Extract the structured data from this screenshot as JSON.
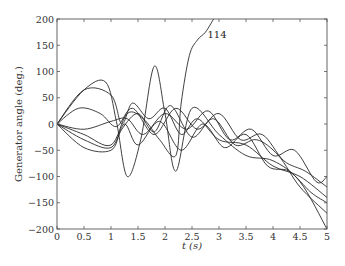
{
  "chart_data": {
    "type": "line",
    "title": "",
    "xlabel": "t (s)",
    "ylabel": "Generator angle (deg.)",
    "xlim": [
      0,
      5
    ],
    "ylim": [
      -200,
      200
    ],
    "grid": false,
    "legend": null,
    "xticks": [
      "0",
      "0.5",
      "1",
      "1.5",
      "2",
      "2.5",
      "3",
      "3.5",
      "4",
      "4.5",
      "5"
    ],
    "yticks": [
      "200",
      "150",
      "100",
      "50",
      "0",
      "-50",
      "-100",
      "-150",
      "-200"
    ],
    "annotations": [
      {
        "text": "114",
        "x": 2.75,
        "y": 170,
        "note": "unstable generator whose angle diverges above 200"
      }
    ],
    "series": [
      {
        "name": "gen-114",
        "x": [
          0,
          0.5,
          1.0,
          1.3,
          1.6,
          1.9,
          2.2,
          2.3,
          2.45,
          2.6,
          2.75,
          2.9
        ],
        "y": [
          0,
          -20,
          -40,
          20,
          10,
          -30,
          -60,
          40,
          130,
          160,
          175,
          200
        ]
      },
      {
        "name": "gen-a",
        "x": [
          0,
          0.5,
          0.9,
          1.1,
          1.3,
          1.55,
          1.8,
          2.0,
          2.2,
          2.5,
          3.0,
          3.5,
          4.0,
          4.5,
          5.0
        ],
        "y": [
          0,
          65,
          80,
          5,
          -100,
          -30,
          110,
          20,
          -90,
          30,
          -20,
          -60,
          -70,
          -110,
          -200
        ]
      },
      {
        "name": "gen-b",
        "x": [
          0,
          0.5,
          1.0,
          1.2,
          1.4,
          1.7,
          2.0,
          2.3,
          2.6,
          3.0,
          3.5,
          4.0,
          4.5,
          5.0
        ],
        "y": [
          0,
          65,
          55,
          0,
          40,
          10,
          30,
          -20,
          10,
          -30,
          -40,
          -80,
          -100,
          -140
        ]
      },
      {
        "name": "gen-c",
        "x": [
          0,
          0.4,
          0.8,
          1.1,
          1.4,
          1.8,
          2.2,
          2.6,
          3.0,
          3.4,
          3.8,
          4.2,
          4.6,
          5.0
        ],
        "y": [
          0,
          30,
          20,
          -5,
          30,
          -20,
          30,
          -10,
          20,
          -30,
          -20,
          -70,
          -90,
          -120
        ]
      },
      {
        "name": "gen-d",
        "x": [
          0,
          0.5,
          1.0,
          1.3,
          1.6,
          2.0,
          2.4,
          2.8,
          3.2,
          3.6,
          4.0,
          4.4,
          4.8,
          5.0
        ],
        "y": [
          0,
          -10,
          5,
          10,
          -20,
          20,
          -10,
          25,
          -30,
          -10,
          -60,
          -50,
          -110,
          -100
        ]
      },
      {
        "name": "gen-e",
        "x": [
          0,
          0.5,
          1.0,
          1.25,
          1.5,
          1.9,
          2.3,
          2.7,
          3.1,
          3.5,
          3.9,
          4.3,
          4.7,
          5.0
        ],
        "y": [
          0,
          -30,
          -45,
          0,
          -40,
          5,
          -50,
          0,
          -45,
          -20,
          -80,
          -90,
          -130,
          -150
        ]
      },
      {
        "name": "gen-f",
        "x": [
          0,
          0.5,
          1.0,
          1.2,
          1.5,
          1.8,
          2.1,
          2.5,
          2.9,
          3.3,
          3.7,
          4.1,
          4.5,
          5.0
        ],
        "y": [
          0,
          -45,
          -50,
          -10,
          20,
          -15,
          35,
          -25,
          10,
          -40,
          -30,
          -60,
          -120,
          -170
        ]
      }
    ]
  }
}
